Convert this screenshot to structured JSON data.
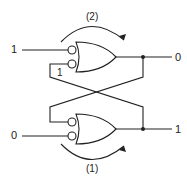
{
  "diagram": {
    "top_gate": {
      "input_label": "1",
      "feedback_label": "1",
      "output_label": "0",
      "arrow_label": "(2)"
    },
    "bottom_gate": {
      "input_label": "0",
      "output_label": "1",
      "arrow_label": "(1)"
    },
    "colors": {
      "line": "#222222",
      "background": "#ffffff"
    }
  }
}
